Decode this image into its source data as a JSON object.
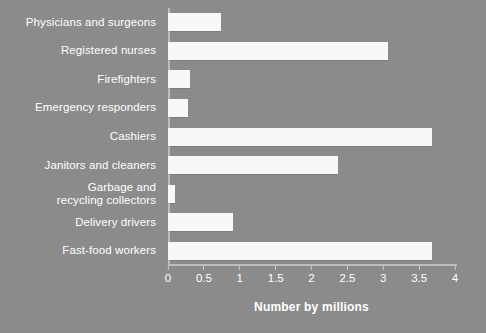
{
  "chart_data": {
    "type": "bar",
    "orientation": "horizontal",
    "title": "",
    "xlabel": "Number by millions",
    "ylabel": "",
    "xlim": [
      0,
      4
    ],
    "xticks": [
      "0",
      "0.5",
      "1",
      "1.5",
      "2",
      "2.5",
      "3",
      "3.5",
      "4"
    ],
    "xtick_values": [
      0,
      0.5,
      1,
      1.5,
      2,
      2.5,
      3,
      3.5,
      4
    ],
    "grid": false,
    "legend": null,
    "categories": [
      "Physicians and surgeons",
      "Registered nurses",
      "Firefighters",
      "Emergency responders",
      "Cashiers",
      "Janitors and cleaners",
      "Garbage and\nrecycling collectors",
      "Delivery drivers",
      "Fast-food workers"
    ],
    "values": [
      0.74,
      3.07,
      0.31,
      0.28,
      3.68,
      2.37,
      0.1,
      0.91,
      3.68
    ],
    "colors": {
      "background": "#8b8b8b",
      "bar": "#f8f8f8",
      "text": "#ffffff",
      "axis": "#bdbdbd"
    }
  }
}
